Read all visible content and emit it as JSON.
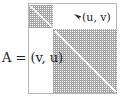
{
  "diagram": {
    "matrix_label": "A = (v, u)",
    "entry_label": "(u, v)",
    "arrow_icon": "arrow-pointer-icon",
    "blocks": [
      {
        "name": "small-block",
        "pattern": "dotted-grid",
        "has_diagonal": true
      },
      {
        "name": "large-block",
        "pattern": "dotted-grid",
        "has_diagonal": true
      }
    ],
    "colors": {
      "grid": "#8a8a8a",
      "frame": "#b8b8b8",
      "text": "#222222",
      "background": "#ffffff"
    }
  }
}
